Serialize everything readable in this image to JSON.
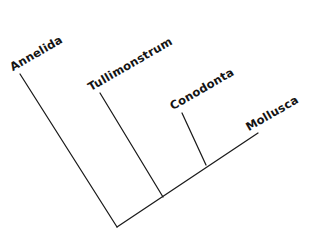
{
  "figure": {
    "type": "cladogram",
    "background_color": "#ffffff",
    "line_color": "#1a1a1a",
    "text_color": "#141414",
    "label_rotation_deg": -30,
    "width": 325,
    "height": 239
  },
  "taxa": [
    {
      "id": "annelida",
      "label": "Annelida",
      "label_x": 14,
      "label_y": 62,
      "rotation": -30,
      "tip_x": 20,
      "tip_y": 74
    },
    {
      "id": "tullimonstrum",
      "label": "Tullimonstrum",
      "label_x": 92,
      "label_y": 82,
      "rotation": -30,
      "tip_x": 100,
      "tip_y": 93
    },
    {
      "id": "conodonta",
      "label": "Conodonta",
      "label_x": 174,
      "label_y": 101,
      "rotation": -30,
      "tip_x": 182,
      "tip_y": 113
    },
    {
      "id": "mollusca",
      "label": "Mollusca",
      "label_x": 250,
      "label_y": 122,
      "rotation": -30,
      "tip_x": 258,
      "tip_y": 133
    }
  ],
  "nodes": [
    {
      "id": "root",
      "x": 117,
      "y": 227
    },
    {
      "id": "node-tullimonstrum",
      "x": 163,
      "y": 197
    },
    {
      "id": "node-conodonta",
      "x": 206,
      "y": 165
    }
  ],
  "branches": [
    {
      "id": "branch-annelida",
      "from": "root",
      "points": "20,74 117,227"
    },
    {
      "id": "branch-spine",
      "from": "root",
      "points": "117,227 258,133"
    },
    {
      "id": "branch-tullimonstrum",
      "from": "node-tullimonstrum",
      "points": "100,93 163,197"
    },
    {
      "id": "branch-conodonta",
      "from": "node-conodonta",
      "points": "182,113 206,165"
    }
  ]
}
